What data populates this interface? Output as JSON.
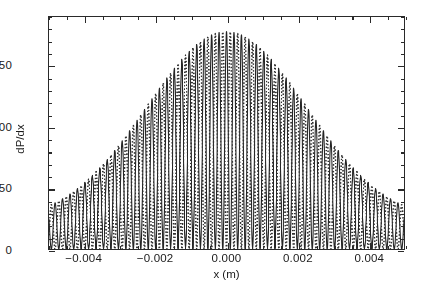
{
  "chart_data": {
    "type": "line",
    "title": "",
    "xlabel": "x (m)",
    "ylabel": "dP/dx",
    "xlim": [
      -0.005,
      0.005
    ],
    "ylim": [
      0,
      190
    ],
    "grid": false,
    "legend_position": "none",
    "xticks": [
      -0.004,
      -0.002,
      0.0,
      0.002,
      0.004
    ],
    "xticklabels": [
      "-0.004",
      "-0.002",
      "0.000",
      "0.002",
      "0.004"
    ],
    "yticks": [
      0,
      50,
      100,
      150
    ],
    "yticklabels": [
      "0",
      "50",
      "100",
      "150"
    ],
    "x_minor_tick_step": 0.0005,
    "y_minor_tick_step": 10,
    "peak_value": 178,
    "peak_x": 0.0,
    "envelope_edge_value": 24,
    "fringe_period_m": 0.00021,
    "series": [
      {
        "name": "solid-trace",
        "style": "solid",
        "color": "#252525",
        "linewidth": 1.1,
        "phase_offset_m": 0.0,
        "envelope_sigma_m": 0.00225,
        "envelope_floor": 0.125,
        "amplitude": 178
      },
      {
        "name": "dotted-trace",
        "style": "dotted",
        "color": "#2f2f2f",
        "linewidth": 1.5,
        "phase_offset_m": 0.000105,
        "envelope_sigma_m": 0.00225,
        "envelope_floor": 0.125,
        "amplitude": 178
      }
    ]
  },
  "axes": {
    "x_title": "x (m)",
    "y_title": "dP/dx"
  },
  "colors": {
    "frame": "#2a2a2a",
    "background": "#ffffff",
    "text": "#1a1a1a",
    "solid_trace": "#252525",
    "dotted_trace": "#2f2f2f"
  }
}
